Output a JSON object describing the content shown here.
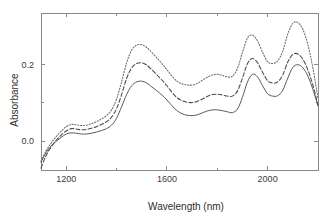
{
  "chart_data": {
    "type": "line",
    "title": "",
    "xlabel": "Wavelength (nm)",
    "ylabel": "Absorbance",
    "xlim": [
      1100,
      2200
    ],
    "ylim": [
      -0.075,
      0.335
    ],
    "grid": false,
    "legend": "none",
    "xticks": [
      1200,
      1600,
      2000
    ],
    "xtick_labels": [
      "1200",
      "1600",
      "2000"
    ],
    "xticks_minor": [
      1400,
      1800,
      2200
    ],
    "yticks": [
      0.0,
      0.2
    ],
    "ytick_labels": [
      "0.0",
      "0.2"
    ],
    "yticks_minor": [
      0.1
    ],
    "x": [
      1100,
      1120,
      1140,
      1160,
      1180,
      1200,
      1220,
      1240,
      1260,
      1280,
      1300,
      1320,
      1340,
      1360,
      1380,
      1400,
      1420,
      1440,
      1460,
      1480,
      1500,
      1520,
      1540,
      1560,
      1580,
      1600,
      1620,
      1640,
      1660,
      1680,
      1700,
      1720,
      1740,
      1760,
      1780,
      1800,
      1820,
      1840,
      1860,
      1880,
      1900,
      1920,
      1940,
      1960,
      1980,
      2000,
      2020,
      2040,
      2060,
      2080,
      2100,
      2120,
      2140,
      2160,
      2180,
      2200
    ],
    "series": [
      {
        "name": "lower-spectrum",
        "style": "solid",
        "color": "#5a5a5a",
        "values": [
          -0.055,
          -0.03,
          -0.012,
          0.0,
          0.01,
          0.019,
          0.022,
          0.021,
          0.019,
          0.019,
          0.021,
          0.024,
          0.028,
          0.033,
          0.042,
          0.06,
          0.09,
          0.122,
          0.145,
          0.155,
          0.157,
          0.152,
          0.142,
          0.132,
          0.121,
          0.108,
          0.093,
          0.08,
          0.072,
          0.068,
          0.067,
          0.069,
          0.074,
          0.079,
          0.082,
          0.082,
          0.08,
          0.077,
          0.075,
          0.084,
          0.115,
          0.155,
          0.175,
          0.168,
          0.145,
          0.124,
          0.118,
          0.119,
          0.133,
          0.165,
          0.193,
          0.2,
          0.192,
          0.17,
          0.135,
          0.092
        ]
      },
      {
        "name": "middle-spectrum",
        "style": "dashed",
        "color": "#4a4a4a",
        "values": [
          -0.07,
          -0.038,
          -0.015,
          0.002,
          0.016,
          0.027,
          0.033,
          0.032,
          0.03,
          0.031,
          0.034,
          0.038,
          0.044,
          0.051,
          0.063,
          0.085,
          0.122,
          0.164,
          0.192,
          0.203,
          0.205,
          0.199,
          0.187,
          0.174,
          0.16,
          0.145,
          0.128,
          0.114,
          0.106,
          0.102,
          0.101,
          0.104,
          0.11,
          0.117,
          0.122,
          0.123,
          0.121,
          0.118,
          0.118,
          0.131,
          0.165,
          0.203,
          0.216,
          0.205,
          0.18,
          0.158,
          0.152,
          0.155,
          0.173,
          0.207,
          0.227,
          0.228,
          0.214,
          0.186,
          0.146,
          0.095
        ]
      },
      {
        "name": "upper-spectrum",
        "style": "dotted",
        "color": "#6a6a6a",
        "values": [
          -0.052,
          -0.025,
          -0.005,
          0.012,
          0.026,
          0.038,
          0.044,
          0.043,
          0.041,
          0.042,
          0.046,
          0.051,
          0.058,
          0.067,
          0.082,
          0.11,
          0.155,
          0.205,
          0.238,
          0.251,
          0.252,
          0.245,
          0.232,
          0.218,
          0.203,
          0.187,
          0.17,
          0.157,
          0.15,
          0.147,
          0.147,
          0.151,
          0.159,
          0.167,
          0.173,
          0.175,
          0.172,
          0.168,
          0.17,
          0.19,
          0.232,
          0.27,
          0.277,
          0.262,
          0.232,
          0.208,
          0.203,
          0.21,
          0.235,
          0.28,
          0.308,
          0.31,
          0.292,
          0.252,
          0.19,
          0.112
        ]
      }
    ]
  }
}
